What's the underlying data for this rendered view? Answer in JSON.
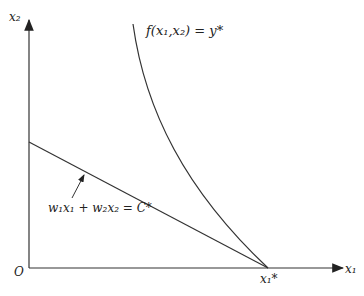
{
  "diagram": {
    "axes": {
      "y_label": "x₂",
      "x_label": "x₁",
      "origin_label": "O"
    },
    "curve_label": "f(x₁,x₂) = y*",
    "line_label": "w₁x₁ + w₂x₂ = C*",
    "tangent_point_label": "x₁*",
    "colors": {
      "line": "#333333",
      "background": "#ffffff"
    }
  }
}
